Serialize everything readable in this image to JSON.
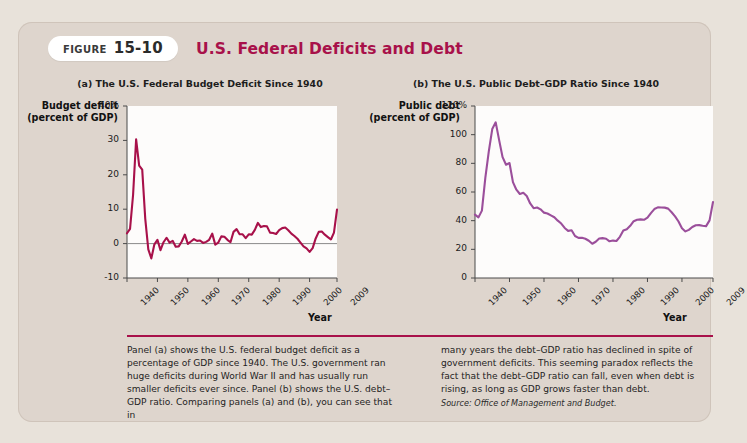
{
  "figure": {
    "badge_label": "FIGURE",
    "badge_number": "15-10",
    "title": "U.S. Federal Deficits and Debt",
    "accent_color": "#a8114a",
    "card_background": "#ded5cd"
  },
  "panel_a": {
    "title": "(a) The U.S. Federal Budget Deficit Since 1940",
    "y_axis_title": "Budget deficit (percent of GDP)",
    "x_axis_title": "Year"
  },
  "panel_b": {
    "title": "(b) The U.S. Public Debt–GDP Ratio Since 1940",
    "y_axis_title": "Public debt (percent of GDP)",
    "x_axis_title": "Year"
  },
  "caption": {
    "left": "Panel (a) shows the U.S. federal budget deficit as a percentage of GDP since 1940. The U.S. government ran huge deficits during World War II and has usually run smaller deficits ever since. Panel (b) shows the U.S. debt–GDP ratio. Comparing panels (a) and (b), you can see that in",
    "right": "many years the debt–GDP ratio has declined in spite of government deficits. This seeming paradox reflects the fact that the debt–GDP ratio can fall, even when debt is rising, as long as GDP grows faster than debt.",
    "source": "Source: Office of Management and Budget."
  },
  "chart_data": [
    {
      "type": "line",
      "panel": "a",
      "title": "(a) The U.S. Federal Budget Deficit Since 1940",
      "xlabel": "Year",
      "ylabel": "Budget deficit (percent of GDP)",
      "xlim": [
        1940,
        2009
      ],
      "ylim": [
        -10,
        40
      ],
      "ytick_labels": [
        "40%",
        "30",
        "20",
        "10",
        "0",
        "-10"
      ],
      "yticks": [
        40,
        30,
        20,
        10,
        0,
        -10
      ],
      "xticks": [
        1940,
        1950,
        1960,
        1970,
        1980,
        1990,
        2000,
        2009
      ],
      "xtick_labels": [
        "1940",
        "1950",
        "1960",
        "1970",
        "1980",
        "1990",
        "2000",
        "2009"
      ],
      "grid": false,
      "legend": "none",
      "line_color": "#a8114a",
      "zero_line": true,
      "series": [
        {
          "name": "Federal budget deficit (% of GDP)",
          "x": [
            1940,
            1941,
            1942,
            1943,
            1944,
            1945,
            1946,
            1947,
            1948,
            1949,
            1950,
            1951,
            1952,
            1953,
            1954,
            1955,
            1956,
            1957,
            1958,
            1959,
            1960,
            1961,
            1962,
            1963,
            1964,
            1965,
            1966,
            1967,
            1968,
            1969,
            1970,
            1971,
            1972,
            1973,
            1974,
            1975,
            1976,
            1977,
            1978,
            1979,
            1980,
            1981,
            1982,
            1983,
            1984,
            1985,
            1986,
            1987,
            1988,
            1989,
            1990,
            1991,
            1992,
            1993,
            1994,
            1995,
            1996,
            1997,
            1998,
            1999,
            2000,
            2001,
            2002,
            2003,
            2004,
            2005,
            2006,
            2007,
            2008,
            2009
          ],
          "values": [
            3.0,
            4.3,
            14.2,
            30.3,
            22.7,
            21.5,
            7.2,
            -1.7,
            -4.3,
            -0.2,
            1.1,
            -1.9,
            0.4,
            1.7,
            0.3,
            0.8,
            -0.9,
            -0.8,
            0.6,
            2.6,
            -0.1,
            0.6,
            1.3,
            0.8,
            0.9,
            0.2,
            0.5,
            1.1,
            2.9,
            -0.3,
            0.3,
            2.1,
            2.0,
            1.1,
            0.4,
            3.4,
            4.2,
            2.7,
            2.7,
            1.6,
            2.7,
            2.6,
            4.0,
            6.0,
            4.8,
            5.1,
            5.0,
            3.2,
            3.1,
            2.8,
            3.9,
            4.5,
            4.7,
            3.9,
            2.9,
            2.2,
            1.4,
            0.3,
            -0.8,
            -1.4,
            -2.4,
            -1.3,
            1.5,
            3.4,
            3.5,
            2.6,
            1.9,
            1.2,
            3.2,
            9.9
          ]
        }
      ]
    },
    {
      "type": "line",
      "panel": "b",
      "title": "(b) The U.S. Public Debt–GDP Ratio Since 1940",
      "xlabel": "Year",
      "ylabel": "Public debt (percent of GDP)",
      "xlim": [
        1940,
        2009
      ],
      "ylim": [
        0,
        120
      ],
      "ytick_labels": [
        "120%",
        "100",
        "80",
        "60",
        "40",
        "20",
        "0"
      ],
      "yticks": [
        120,
        100,
        80,
        60,
        40,
        20,
        0
      ],
      "xticks": [
        1940,
        1950,
        1960,
        1970,
        1980,
        1990,
        2000,
        2009
      ],
      "xtick_labels": [
        "1940",
        "1950",
        "1960",
        "1970",
        "1980",
        "1990",
        "2000",
        "2009"
      ],
      "grid": false,
      "legend": "none",
      "line_color": "#9b4f9b",
      "zero_line": false,
      "series": [
        {
          "name": "Public debt as percent of GDP",
          "x": [
            1940,
            1941,
            1942,
            1943,
            1944,
            1945,
            1946,
            1947,
            1948,
            1949,
            1950,
            1951,
            1952,
            1953,
            1954,
            1955,
            1956,
            1957,
            1958,
            1959,
            1960,
            1961,
            1962,
            1963,
            1964,
            1965,
            1966,
            1967,
            1968,
            1969,
            1970,
            1971,
            1972,
            1973,
            1974,
            1975,
            1976,
            1977,
            1978,
            1979,
            1980,
            1981,
            1982,
            1983,
            1984,
            1985,
            1986,
            1987,
            1988,
            1989,
            1990,
            1991,
            1992,
            1993,
            1994,
            1995,
            1996,
            1997,
            1998,
            1999,
            2000,
            2001,
            2002,
            2003,
            2004,
            2005,
            2006,
            2007,
            2008,
            2009
          ],
          "values": [
            44.2,
            42.3,
            47.0,
            70.0,
            88.3,
            103.9,
            108.6,
            96.2,
            84.3,
            79.0,
            80.2,
            66.9,
            61.6,
            58.6,
            59.5,
            57.2,
            52.0,
            48.7,
            49.2,
            47.9,
            45.6,
            45.0,
            43.7,
            42.4,
            40.0,
            38.0,
            34.9,
            32.9,
            33.3,
            29.3,
            28.0,
            28.1,
            27.4,
            26.0,
            23.9,
            25.3,
            27.5,
            27.8,
            27.4,
            25.6,
            26.1,
            25.8,
            28.7,
            33.1,
            34.0,
            36.4,
            39.6,
            40.6,
            40.9,
            40.6,
            42.1,
            45.3,
            48.1,
            49.3,
            49.2,
            49.1,
            48.4,
            45.9,
            43.0,
            39.4,
            34.7,
            32.5,
            33.6,
            35.6,
            36.8,
            36.9,
            36.5,
            36.2,
            40.2,
            53.0
          ]
        }
      ]
    }
  ]
}
